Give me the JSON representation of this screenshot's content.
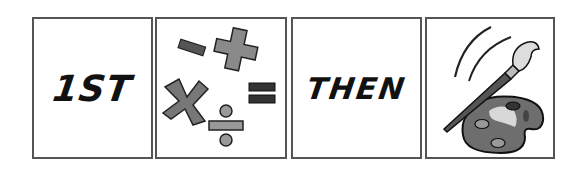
{
  "cards": [
    {
      "label": "1ST",
      "type": "text"
    },
    {
      "label": "",
      "type": "image",
      "icon": "math-symbols-icon",
      "symbols": [
        "minus",
        "plus",
        "multiply",
        "equals",
        "divide"
      ]
    },
    {
      "label": "THEN",
      "type": "text"
    },
    {
      "label": "",
      "type": "image",
      "icon": "paintbrush-palette-icon"
    }
  ],
  "colors": {
    "border": "#555555",
    "text": "#111111",
    "symbol_gray": "#8a8a8a",
    "symbol_dark": "#3a3a3a"
  }
}
